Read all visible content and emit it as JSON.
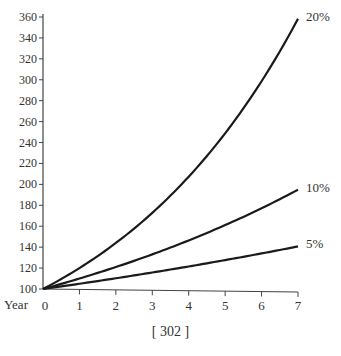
{
  "chart_data": {
    "type": "line",
    "title": "",
    "xlabel": "Year",
    "ylabel": "",
    "x": [
      0,
      1,
      2,
      3,
      4,
      5,
      6,
      7
    ],
    "xticks": [
      "0",
      "1",
      "2",
      "3",
      "4",
      "5",
      "6",
      "7"
    ],
    "yticks": [
      100,
      120,
      140,
      160,
      180,
      200,
      220,
      240,
      260,
      280,
      300,
      320,
      340,
      360
    ],
    "xlim": [
      0,
      7
    ],
    "ylim": [
      100,
      360
    ],
    "grid": false,
    "legend_position": "inline-right-end",
    "series": [
      {
        "name": "20%",
        "values": [
          100,
          120,
          144,
          172.8,
          207.4,
          248.8,
          298.6,
          358.3
        ]
      },
      {
        "name": "10%",
        "values": [
          100,
          110,
          121,
          133.1,
          146.4,
          161.1,
          177.2,
          194.9
        ]
      },
      {
        "name": "5%",
        "values": [
          100,
          105,
          110.3,
          115.8,
          121.6,
          127.6,
          134.0,
          140.7
        ]
      }
    ],
    "annotations": [
      "20%",
      "10%",
      "5%"
    ]
  },
  "axis": {
    "x_label": "Year"
  },
  "footer": {
    "page_number": "[ 302 ]"
  }
}
